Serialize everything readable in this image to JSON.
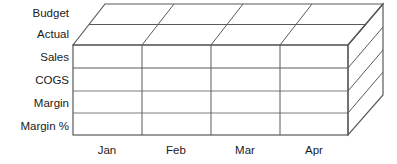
{
  "diagram": {
    "type": "3d-cube",
    "colors": {
      "stroke": "#4d4d4d",
      "grid": "#5a5a5a",
      "face": "#ffffff",
      "text": "#1a1a1a"
    },
    "measures_axis": {
      "name": "Measures",
      "labels": [
        {
          "text": "Sales"
        },
        {
          "text": "COGS"
        },
        {
          "text": "Margin"
        },
        {
          "text": "Margin %"
        }
      ]
    },
    "scenario_axis": {
      "name": "Scenario",
      "labels": [
        {
          "text": "Budget"
        },
        {
          "text": "Actual"
        }
      ]
    },
    "time_axis": {
      "name": "Time",
      "labels": [
        {
          "text": "Jan"
        },
        {
          "text": "Feb"
        },
        {
          "text": "Mar"
        },
        {
          "text": "Apr"
        }
      ]
    }
  }
}
